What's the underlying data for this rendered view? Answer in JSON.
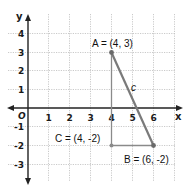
{
  "diagram": {
    "type": "coordinate-plane-right-triangle",
    "axes": {
      "x_label": "x",
      "y_label": "y",
      "origin_label": "O",
      "x_ticks": [
        "1",
        "2",
        "3",
        "4",
        "5",
        "6"
      ],
      "y_ticks_positive": [
        "1",
        "2",
        "3",
        "4"
      ],
      "y_ticks_negative": [
        "-1",
        "-2",
        "-3"
      ]
    },
    "points": {
      "A": {
        "label": "A = (4, 3)",
        "x": 4,
        "y": 3
      },
      "B": {
        "label": "B = (6, -2)",
        "x": 6,
        "y": -2
      },
      "C": {
        "label": "C = (4, -2)",
        "x": 4,
        "y": -2
      }
    },
    "segments": {
      "hypotenuse_label": "c"
    },
    "colors": {
      "segment": "#7a7a7a",
      "axis": "#222222",
      "grid": "#b8b8b8",
      "point": "#6a6a6a"
    }
  }
}
